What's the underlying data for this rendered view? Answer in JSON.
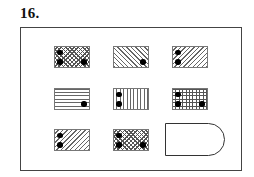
{
  "question": {
    "number_label": "16."
  },
  "grid": {
    "rows": 3,
    "columns": 3,
    "tiles": [
      {
        "row": 1,
        "col": 1,
        "pattern": "diagonal-crosshatch",
        "dots": [
          "top-left",
          "bottom-left",
          "bottom-right"
        ],
        "dot_count": 3
      },
      {
        "row": 1,
        "col": 2,
        "pattern": "diagonal-back-slash",
        "dots": [
          "bottom-right"
        ],
        "dot_count": 1
      },
      {
        "row": 1,
        "col": 3,
        "pattern": "diagonal-forward-slash",
        "dots": [
          "top-left",
          "bottom-left"
        ],
        "dot_count": 2
      },
      {
        "row": 2,
        "col": 1,
        "pattern": "horizontal-lines",
        "dots": [
          "bottom-right"
        ],
        "dot_count": 1
      },
      {
        "row": 2,
        "col": 2,
        "pattern": "vertical-lines",
        "dots": [
          "top-left",
          "bottom-left"
        ],
        "dot_count": 2
      },
      {
        "row": 2,
        "col": 3,
        "pattern": "square-grid",
        "dots": [
          "top-left",
          "bottom-left",
          "bottom-right"
        ],
        "dot_count": 3
      },
      {
        "row": 3,
        "col": 1,
        "pattern": "diagonal-forward-slash",
        "dots": [
          "top-left",
          "bottom-left"
        ],
        "dot_count": 2
      },
      {
        "row": 3,
        "col": 2,
        "pattern": "diagonal-crosshatch",
        "dots": [
          "top-left",
          "bottom-left",
          "bottom-right"
        ],
        "dot_count": 3
      },
      {
        "row": 3,
        "col": 3,
        "pattern": "answer-slot",
        "shape": "rounded-right-rectangle",
        "dots": [],
        "dot_count": null
      }
    ]
  },
  "colors": {
    "line": "#666666",
    "dot": "#000000",
    "frame": "#444444",
    "background": "#ffffff"
  }
}
